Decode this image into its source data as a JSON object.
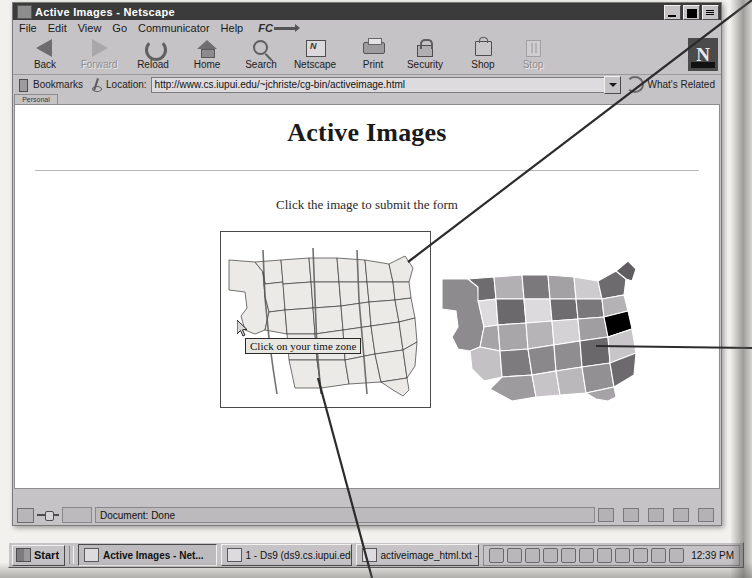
{
  "window": {
    "title": "Active Images - Netscape",
    "icon": "netscape-document-icon",
    "controls": {
      "minimize": "Minimize",
      "maximize": "Maximize",
      "close": "Close"
    }
  },
  "menubar": {
    "items": [
      {
        "label": "File",
        "mnemonic": "F"
      },
      {
        "label": "Edit",
        "mnemonic": "E"
      },
      {
        "label": "View",
        "mnemonic": "V"
      },
      {
        "label": "Go",
        "mnemonic": "G"
      },
      {
        "label": "Communicator",
        "mnemonic": "C"
      },
      {
        "label": "Help",
        "mnemonic": "H"
      }
    ],
    "brand": "FC"
  },
  "toolbar": {
    "buttons": [
      {
        "label": "Back",
        "icon": "back-arrow-icon",
        "enabled": true
      },
      {
        "label": "Forward",
        "icon": "forward-arrow-icon",
        "enabled": false
      },
      {
        "label": "Reload",
        "icon": "reload-icon",
        "enabled": true
      },
      {
        "label": "Home",
        "icon": "home-icon",
        "enabled": true
      },
      {
        "label": "Search",
        "icon": "search-icon",
        "enabled": true
      },
      {
        "label": "Netscape",
        "icon": "netscape-icon",
        "enabled": true
      },
      {
        "label": "Print",
        "icon": "printer-icon",
        "enabled": true
      },
      {
        "label": "Security",
        "icon": "lock-icon",
        "enabled": true
      },
      {
        "label": "Shop",
        "icon": "shopping-bag-icon",
        "enabled": true
      },
      {
        "label": "Stop",
        "icon": "stop-icon",
        "enabled": false
      }
    ],
    "logo": "N"
  },
  "locationbar": {
    "bookmarks_label": "Bookmarks",
    "location_label": "Location:",
    "url": "http://www.cs.iupui.edu/~jchriste/cg-bin/activeimage.html",
    "url_placeholder": "Enter address",
    "whats_related": "What's Related",
    "personal_tab": "Personal"
  },
  "content": {
    "heading": "Active Images",
    "instruction": "Click the image to submit the form",
    "map1": {
      "name": "us-timezone-outline-map",
      "tooltip": "Click on your time zone",
      "cursor": "arrow-cursor"
    },
    "map2": {
      "name": "us-shaded-states-map"
    }
  },
  "statusbar": {
    "security_icon": "padlock-icon",
    "connection_icon": "connection-icon",
    "message": "Document: Done"
  },
  "taskbar": {
    "start_label": "Start",
    "tasks": [
      {
        "label": "Active Images - Net...",
        "icon": "netscape-icon",
        "active": true
      },
      {
        "label": "1 - Ds9 (ds9.cs.iupui.edu)",
        "icon": "terminal-icon",
        "active": false
      },
      {
        "label": "activeimage_html.txt - No...",
        "icon": "notepad-icon",
        "active": false
      }
    ],
    "tray_icons": [
      "display-icon",
      "volume-icon",
      "network-icon",
      "modem-icon",
      "pointer-icon",
      "headset-icon",
      "disk-icon",
      "clock-tray-icon",
      "key-icon",
      "monitor-icon",
      "printer-tray-icon"
    ],
    "clock": "12:39 PM"
  },
  "colors": {
    "titlebar": "#3b3b3b",
    "chrome": "#c6c3c6",
    "content_bg": "#ffffff",
    "text": "#1a1a1a",
    "field_bg": "#dedbde",
    "annotation_line": "#2b2b2b"
  },
  "annotations": {
    "leader_to_map1": "leader-line-upper-right",
    "leader_to_map2": "leader-line-right",
    "leader_from_tooltip": "leader-line-bottom"
  }
}
